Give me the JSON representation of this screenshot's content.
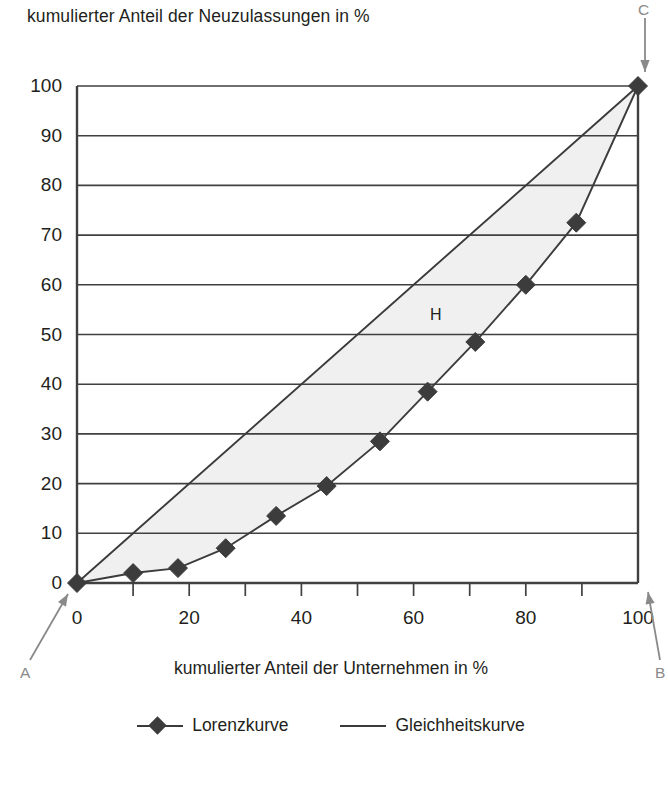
{
  "chart_data": {
    "type": "line",
    "title": "kumulierter Anteil der Neuzulassungen in %",
    "xlabel": "kumulierter Anteil der Unternehmen in %",
    "ylabel": "kumulierter Anteil der Neuzulassungen in %",
    "xlim": [
      0,
      100
    ],
    "ylim": [
      0,
      100
    ],
    "grid": true,
    "grid_axis": "y",
    "legend_position": "bottom",
    "xticks": [
      0,
      20,
      40,
      60,
      80,
      100
    ],
    "xtick_labels": [
      "0",
      "20",
      "40",
      "60",
      "80",
      "100"
    ],
    "xminor_ticks": [
      10,
      30,
      50,
      70,
      90
    ],
    "yticks": [
      0,
      10,
      20,
      30,
      40,
      50,
      60,
      70,
      80,
      90,
      100
    ],
    "ytick_labels": [
      "0",
      "10",
      "20",
      "30",
      "40",
      "50",
      "60",
      "70",
      "80",
      "90",
      "100"
    ],
    "series": [
      {
        "name": "Lorenzkurve",
        "marker": "diamond",
        "color": "#3c3c3c",
        "x": [
          0,
          10,
          18,
          26.5,
          35.5,
          44.5,
          54,
          62.5,
          71,
          80,
          89,
          100
        ],
        "y": [
          0,
          2,
          3,
          7,
          13.5,
          19.5,
          28.5,
          38.5,
          48.5,
          60,
          72.5,
          100
        ]
      },
      {
        "name": "Gleichheitskurve",
        "marker": "none",
        "color": "#3a3a3a",
        "x": [
          0,
          100
        ],
        "y": [
          0,
          100
        ]
      }
    ],
    "shaded_region": {
      "label": "H",
      "fill": "#f0f0f0",
      "between": [
        "Gleichheitskurve",
        "Lorenzkurve"
      ]
    },
    "annotations": [
      {
        "label": "C",
        "target_x": 100,
        "target_y": 100,
        "position": "top"
      },
      {
        "label": "A",
        "target_x": 0,
        "target_y": 0,
        "position": "bottom-left"
      },
      {
        "label": "B",
        "target_x": 100,
        "target_y": 0,
        "position": "bottom-right"
      },
      {
        "label": "H",
        "target_x": 64,
        "target_y": 54,
        "position": "inside"
      }
    ]
  },
  "legend": {
    "entries": [
      {
        "label": "Lorenzkurve"
      },
      {
        "label": "Gleichheitskurve"
      }
    ]
  },
  "colors": {
    "axis": "#404040",
    "grid": "#404040",
    "marker": "#3c3c3c",
    "shade": "#f0f0f0",
    "annotation": "#8a8a8a",
    "text": "#231f20"
  }
}
